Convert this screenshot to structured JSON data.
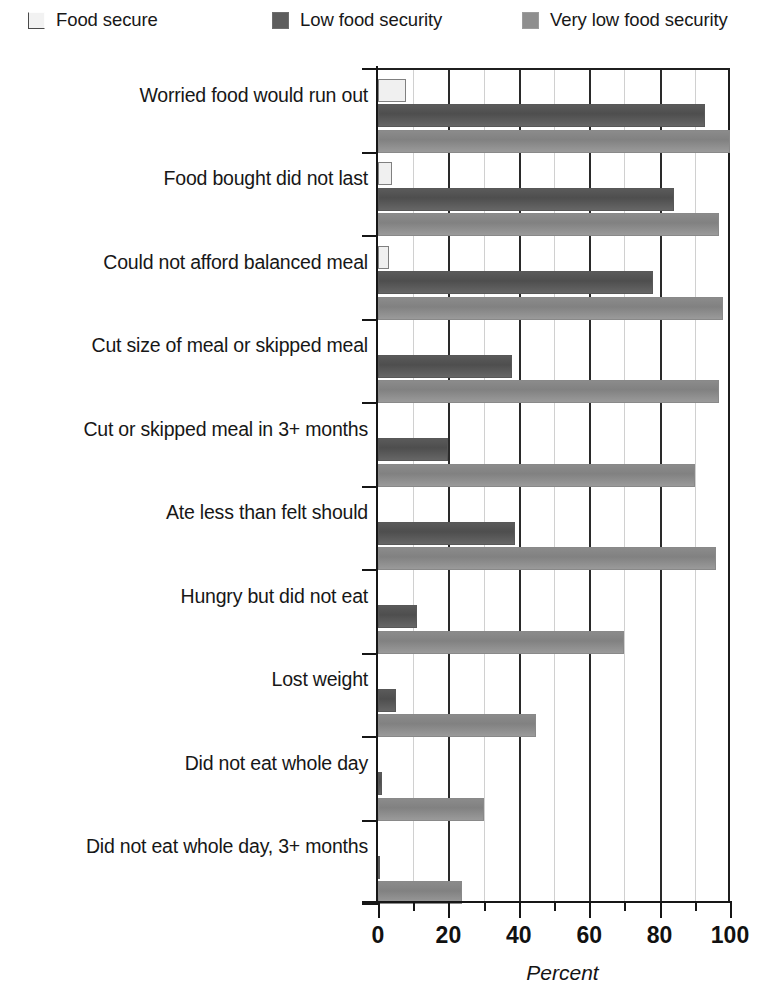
{
  "legend": {
    "position": "top",
    "entries": [
      {
        "label": "Food secure",
        "color": "#f0f0f0",
        "swatch": "food-secure-swatch"
      },
      {
        "label": "Low food security",
        "color": "#5d5d5d",
        "swatch": "low-food-security-swatch"
      },
      {
        "label": "Very low food security",
        "color": "#8f8f8f",
        "swatch": "very-low-food-security-swatch"
      }
    ]
  },
  "chart_data": {
    "type": "bar",
    "orientation": "horizontal",
    "title": "",
    "subtitle": "",
    "xlabel": "Percent",
    "ylabel": "",
    "xlim": [
      0,
      100
    ],
    "ylim": [
      0,
      10
    ],
    "grid": true,
    "grid_axis": "x",
    "legend_position": "top",
    "xticks": [
      0,
      20,
      40,
      60,
      80,
      100
    ],
    "xticklabels": [
      "0",
      "20",
      "40",
      "60",
      "80",
      "100"
    ],
    "xminorticks": [
      10,
      30,
      50,
      70,
      90
    ],
    "categories": [
      "Worried food would run out",
      "Food bought did not last",
      "Could not afford balanced meal",
      "Cut size of meal or skipped meal",
      "Cut or skipped meal in 3+ months",
      "Ate less than felt should",
      "Hungry but did not eat",
      "Lost weight",
      "Did not eat whole day",
      "Did not eat whole day, 3+ months"
    ],
    "series": [
      {
        "name": "Food secure",
        "color": "#f0f0f0",
        "values": [
          8,
          4,
          3,
          0,
          0,
          0,
          0,
          0,
          0,
          0
        ]
      },
      {
        "name": "Low food security",
        "color": "#5d5d5d",
        "values": [
          93,
          84,
          78,
          38,
          20,
          39,
          11,
          5,
          1,
          0.5
        ]
      },
      {
        "name": "Very low food security",
        "color": "#8f8f8f",
        "values": [
          100,
          97,
          98,
          97,
          90,
          96,
          70,
          45,
          30,
          24
        ]
      }
    ]
  }
}
